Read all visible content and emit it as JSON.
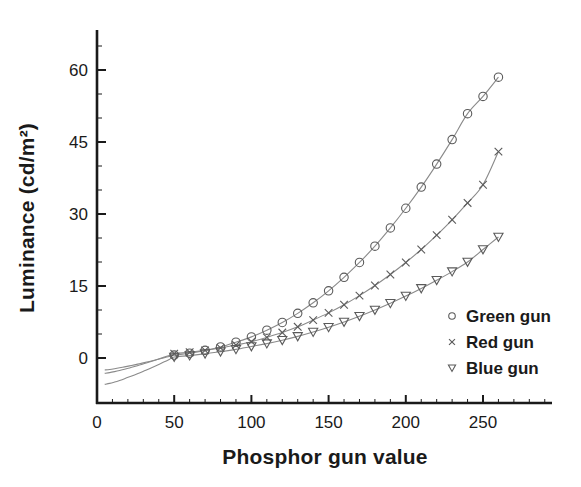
{
  "chart_data": {
    "type": "scatter",
    "title": "",
    "xlabel": "Phosphor gun value",
    "ylabel": "Luminance (cd/m²)",
    "xlim": [
      0,
      310
    ],
    "ylim": [
      -8,
      66
    ],
    "xticks": [
      0,
      50,
      100,
      150,
      200,
      250
    ],
    "yticks": [
      0,
      15,
      30,
      45,
      60
    ],
    "grid": false,
    "legend_position": "lower right",
    "x": [
      50,
      60,
      70,
      80,
      90,
      100,
      110,
      120,
      130,
      140,
      150,
      160,
      170,
      180,
      190,
      200,
      210,
      220,
      230,
      240,
      250,
      260
    ],
    "series": [
      {
        "name": "Green gun",
        "marker": "circle",
        "color": "#555555",
        "values": [
          0.6,
          1.0,
          1.6,
          2.3,
          3.3,
          4.4,
          5.8,
          7.4,
          9.3,
          11.5,
          14.0,
          16.8,
          19.9,
          23.3,
          27.1,
          31.2,
          35.6,
          40.4,
          45.5,
          50.9,
          54.5,
          58.5
        ],
        "fit_curve_start_value": -2.5
      },
      {
        "name": "Red gun",
        "marker": "cross",
        "color": "#555555",
        "values": [
          0.9,
          1.2,
          1.6,
          2.1,
          2.7,
          3.4,
          4.3,
          5.3,
          6.5,
          7.9,
          9.4,
          11.1,
          13.0,
          15.1,
          17.4,
          19.9,
          22.6,
          25.6,
          28.8,
          32.3,
          36.1,
          43.0
        ],
        "fit_curve_start_value": -3.2
      },
      {
        "name": "Blue gun",
        "marker": "triangle-down",
        "color": "#555555",
        "values": [
          0.2,
          0.5,
          0.9,
          1.3,
          1.8,
          2.4,
          3.0,
          3.7,
          4.5,
          5.4,
          6.4,
          7.5,
          8.7,
          10.0,
          11.4,
          12.9,
          14.5,
          16.2,
          18.0,
          20.0,
          22.6,
          25.2
        ],
        "fit_curve_start_value": -5.5
      }
    ]
  },
  "legend": {
    "entries": [
      {
        "label": "Green gun",
        "marker": "circle"
      },
      {
        "label": "Red gun",
        "marker": "cross"
      },
      {
        "label": "Blue gun",
        "marker": "triangle-down"
      }
    ]
  },
  "axes": {
    "x_title": "Phosphor gun value",
    "y_title": "Luminance (cd/m²)",
    "x_tick_labels": [
      "0",
      "50",
      "100",
      "150",
      "200",
      "250"
    ],
    "y_tick_labels": [
      "0",
      "15",
      "30",
      "45",
      "60"
    ]
  },
  "colors": {
    "axis": "#1a1a1a",
    "marker": "#5a5a5a",
    "curve": "#8a8a8a",
    "background": "#ffffff"
  }
}
